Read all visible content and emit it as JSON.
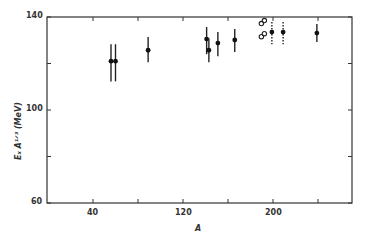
{
  "chart_data": {
    "type": "scatter",
    "title": "",
    "xlabel": "A",
    "ylabel": "E_x A^{1/3} (MeV)",
    "xlim": [
      0,
      270
    ],
    "ylim": [
      60,
      140
    ],
    "x_ticks": [
      40,
      80,
      120,
      160,
      200,
      240
    ],
    "x_tick_labels": [
      "40",
      "",
      "120",
      "",
      "200",
      ""
    ],
    "y_ticks": [
      60,
      80,
      100,
      120,
      140
    ],
    "y_tick_labels": [
      "60",
      "",
      "100",
      "",
      "140"
    ],
    "grid": false,
    "legend": null,
    "series": [
      {
        "name": "filled points (solid error bars)",
        "marker": "filled-circle",
        "points": [
          {
            "x": 56,
            "y": 121.0,
            "ylow": 112.3,
            "yhigh": 128.3
          },
          {
            "x": 60,
            "y": 121.0,
            "ylow": 112.3,
            "yhigh": 128.3
          },
          {
            "x": 89,
            "y": 125.7,
            "ylow": 120.5,
            "yhigh": 131.4
          },
          {
            "x": 141,
            "y": 130.5,
            "ylow": 124.0,
            "yhigh": 135.7
          },
          {
            "x": 143,
            "y": 125.7,
            "ylow": 120.5,
            "yhigh": 130.9
          },
          {
            "x": 151,
            "y": 128.8,
            "ylow": 123.1,
            "yhigh": 133.5
          },
          {
            "x": 166,
            "y": 130.1,
            "ylow": 124.9,
            "yhigh": 134.8
          },
          {
            "x": 239,
            "y": 133.1,
            "ylow": 129.2,
            "yhigh": 137.0
          }
        ]
      },
      {
        "name": "filled points (dashed error bars)",
        "marker": "filled-circle",
        "points": [
          {
            "x": 199,
            "y": 133.5,
            "ylow": 128.3,
            "yhigh": 137.8
          },
          {
            "x": 209,
            "y": 133.5,
            "ylow": 128.3,
            "yhigh": 137.8
          }
        ]
      },
      {
        "name": "open double-circle points",
        "marker": "open-double-circle",
        "points": [
          {
            "x": 191,
            "y": 137.8
          },
          {
            "x": 191,
            "y": 132.2
          }
        ]
      }
    ]
  },
  "labels": {
    "y140": "140",
    "y100": "100",
    "y60": "60",
    "x40": "40",
    "x120": "120",
    "x200": "200",
    "xlabel": "A",
    "ylabel": "Eₓ A¹ᐟ³ (MeV)"
  }
}
